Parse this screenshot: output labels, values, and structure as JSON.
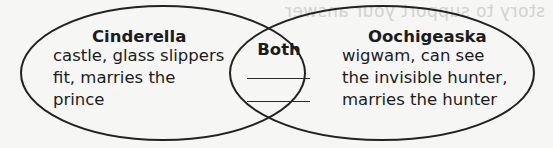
{
  "diagram": {
    "type": "venn",
    "colors": {
      "background": "#f6f6f4",
      "stroke": "#222222",
      "text": "#1c1c1c",
      "ghost_text": "#d2d2d0"
    },
    "ghost_text": "story to support your answer",
    "left": {
      "title": "Cinderella",
      "lines": [
        "castle, glass slippers",
        "fit, marries the",
        "prince"
      ]
    },
    "center": {
      "title": "Both",
      "blanks": 2
    },
    "right": {
      "title": "Oochigeaska",
      "lines": [
        "wigwam, can see",
        "the invisible hunter,",
        "marries the hunter"
      ]
    }
  }
}
